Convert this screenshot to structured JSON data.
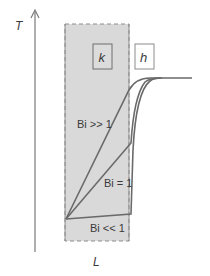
{
  "diagram": {
    "axis_y_label": "T",
    "axis_x_label": "L",
    "solid_label": "k",
    "fluid_label": "h",
    "curves": [
      {
        "name": "bi-much-greater-than-one",
        "label": "Bi >> 1"
      },
      {
        "name": "bi-equal-one",
        "label": "Bi = 1"
      },
      {
        "name": "bi-much-less-than-one",
        "label": "Bi << 1"
      }
    ],
    "colors": {
      "slab_fill": "#d9d9d9",
      "slab_border": "#8c8c8c",
      "curve": "#6a6a6a",
      "axis": "#7a7a7a",
      "text": "#3a3a3a"
    }
  }
}
